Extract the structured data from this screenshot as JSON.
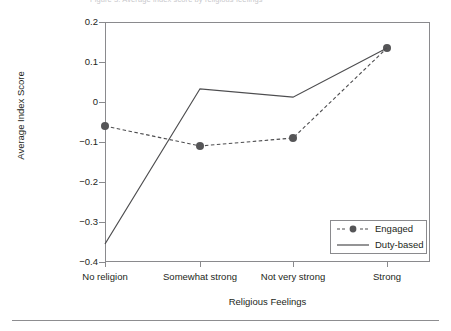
{
  "figure": {
    "top_caption_fragment": "Figure 3. Average index score by religious feelings",
    "has_bottom_rule": true
  },
  "chart_data": {
    "type": "line",
    "title": "",
    "xlabel": "Religious Feelings",
    "ylabel": "Average Index Score",
    "categories": [
      "No religion",
      "Somewhat strong",
      "Not very strong",
      "Strong"
    ],
    "ylim": [
      -0.4,
      0.2
    ],
    "yticks": [
      0.2,
      0.1,
      0,
      -0.1,
      -0.2,
      -0.3,
      -0.4
    ],
    "ytick_labels": [
      "0.2",
      "0.1",
      "0",
      "−0.1",
      "−0.2",
      "−0.3",
      "−0.4"
    ],
    "grid": false,
    "legend_position": "lower right",
    "series": [
      {
        "name": "Engaged",
        "values": [
          -0.06,
          -0.11,
          -0.09,
          0.135
        ],
        "style": "dashed",
        "marker": "circle",
        "color": "#4d4d4f"
      },
      {
        "name": "Duty-based",
        "values": [
          -0.355,
          0.033,
          0.012,
          0.135
        ],
        "style": "solid",
        "marker": "none",
        "color": "#4d4d4f"
      }
    ]
  },
  "legend": {
    "items": [
      {
        "label": "Engaged",
        "style": "dashed-marker"
      },
      {
        "label": "Duty-based",
        "style": "solid"
      }
    ]
  },
  "colors": {
    "axis": "#8a8a8d",
    "line": "#4d4d4f",
    "marker": "#555557",
    "text": "#231f20",
    "background": "#ffffff"
  }
}
